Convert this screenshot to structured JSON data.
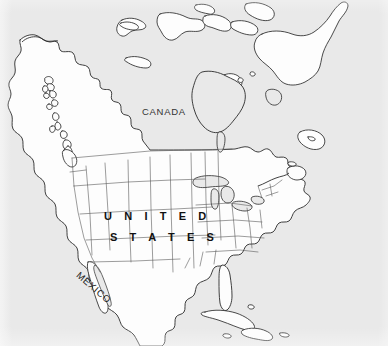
{
  "figure": {
    "kind": "outline-map",
    "region": "North America",
    "width": 388,
    "height": 346
  },
  "colors": {
    "ocean": "#e9e9e9",
    "land": "#fdfdfd",
    "coastline": "#2a2a2a",
    "state_border": "#4a4a4a",
    "label_text": "#1b1b1b",
    "page_background": "#ffffff"
  },
  "labels": {
    "canada": "CANADA",
    "united_states_line1": "U N I T E D",
    "united_states_line2": "S T A T E S",
    "mexico": "MEXICO"
  },
  "features": {
    "countries": [
      "CANADA",
      "UNITED STATES",
      "MEXICO"
    ],
    "water_bodies": [
      "Pacific Ocean",
      "Atlantic Ocean",
      "Hudson Bay",
      "Gulf of Mexico",
      "Great Lakes"
    ],
    "islands": [
      "Baffin Island",
      "Victoria Island",
      "Banks Island",
      "Newfoundland",
      "Cuba",
      "Hispaniola",
      "Puerto Rico"
    ]
  }
}
